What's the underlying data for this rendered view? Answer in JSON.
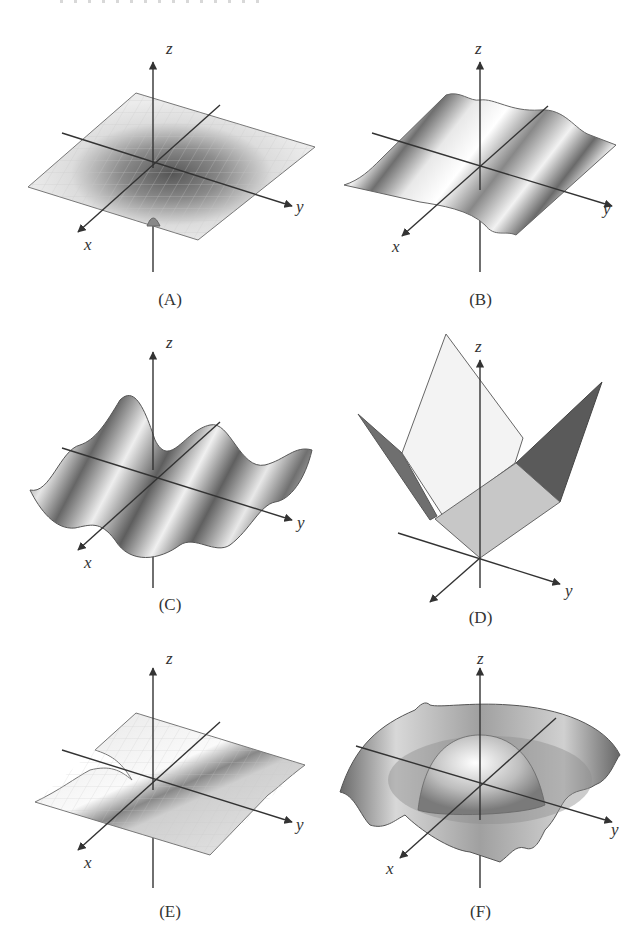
{
  "figure": {
    "panels": [
      {
        "id": "A",
        "caption": "(A)",
        "axes": {
          "x": "x",
          "y": "y",
          "z": "z"
        },
        "surface": "flat sheet with a central funnel-shaped dip and a small bump beneath the origin"
      },
      {
        "id": "B",
        "caption": "(B)",
        "axes": {
          "x": "x",
          "y": "y",
          "z": "z"
        },
        "surface": "gentle ripples varying along y only"
      },
      {
        "id": "C",
        "caption": "(C)",
        "axes": {
          "x": "x",
          "y": "y",
          "z": "z"
        },
        "surface": "large sinusoidal waves varying along y"
      },
      {
        "id": "D",
        "caption": "(D)",
        "axes": {
          "x": "x",
          "y": "y",
          "z": "z"
        },
        "surface": "piecewise planar V-shaped folded surface"
      },
      {
        "id": "E",
        "caption": "(E)",
        "axes": {
          "x": "x",
          "y": "y",
          "z": "z"
        },
        "surface": "flat sheet with a saddle-like trough through the origin"
      },
      {
        "id": "F",
        "caption": "(F)",
        "axes": {
          "x": "x",
          "y": "y",
          "z": "z"
        },
        "surface": "radial bowl with central dome and outer wavy rim"
      }
    ],
    "colors": {
      "axis": "#333333",
      "surface_light": "#e6e6e6",
      "surface_mid": "#a9a9a9",
      "surface_dark": "#5a5a5a",
      "edge": "#666666"
    }
  }
}
